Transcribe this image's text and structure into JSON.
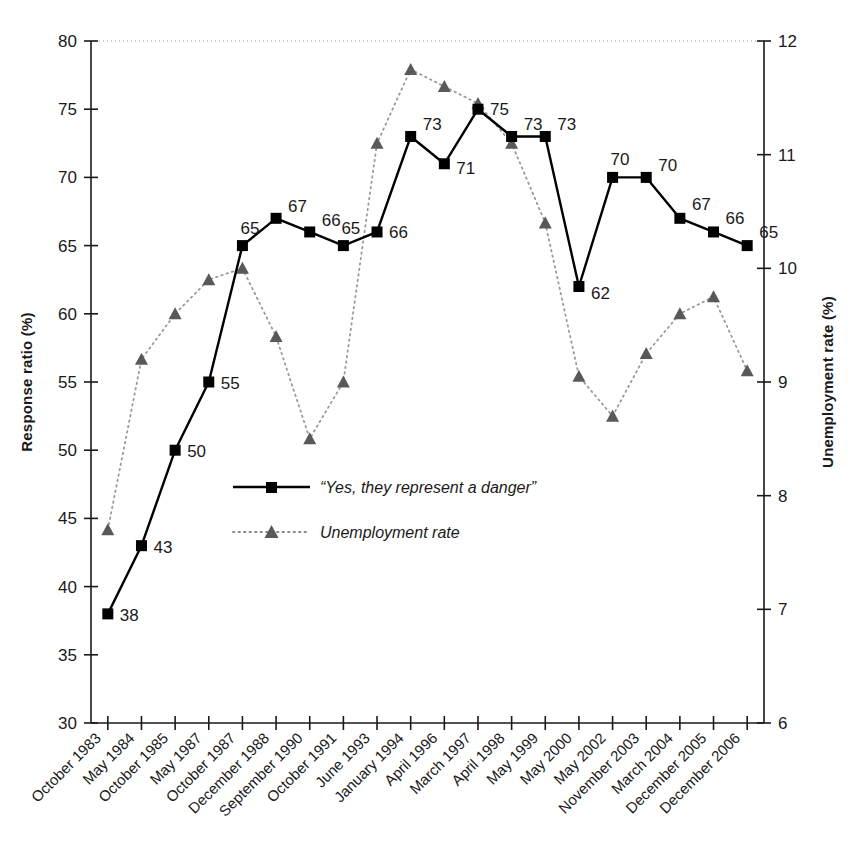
{
  "chart_data": {
    "type": "line",
    "title": "",
    "xlabel": "",
    "ylabel": "Response ratio (%)",
    "y2label": "Unemployment rate (%)",
    "ylim": [
      30,
      80
    ],
    "y2lim": [
      6,
      12
    ],
    "yticks": [
      30,
      35,
      40,
      45,
      50,
      55,
      60,
      65,
      70,
      75,
      80
    ],
    "y2ticks": [
      6,
      7,
      8,
      9,
      10,
      11,
      12
    ],
    "grid": false,
    "legend_position": "center",
    "categories": [
      "October 1983",
      "May 1984",
      "October 1985",
      "May 1987",
      "October 1987",
      "December 1988",
      "September 1990",
      "October 1991",
      "June 1993",
      "January 1994",
      "April 1996",
      "March 1997",
      "April 1998",
      "May 1999",
      "May 2000",
      "May 2002",
      "November 2003",
      "March 2004",
      "December 2005",
      "December 2006"
    ],
    "series": [
      {
        "name": "“Yes, they represent a danger”",
        "axis": "left",
        "marker": "square",
        "line_style": "solid",
        "color": "#000000",
        "labels_shown": true,
        "values": [
          38,
          43,
          50,
          55,
          65,
          67,
          66,
          65,
          66,
          73,
          71,
          75,
          73,
          73,
          62,
          70,
          70,
          67,
          66,
          65
        ]
      },
      {
        "name": "Unemployment rate",
        "axis": "right",
        "marker": "triangle",
        "line_style": "dotted",
        "color": "#595959",
        "labels_shown": false,
        "values": [
          7.7,
          9.2,
          9.6,
          9.9,
          10.0,
          9.4,
          8.5,
          9.0,
          11.1,
          11.75,
          11.6,
          11.45,
          11.1,
          10.4,
          9.05,
          8.7,
          9.25,
          9.6,
          9.75,
          9.1
        ]
      }
    ]
  },
  "legend": {
    "items": [
      {
        "label": "“Yes, they represent a danger”",
        "marker": "square",
        "style": "solid"
      },
      {
        "label": "Unemployment rate",
        "marker": "triangle",
        "style": "dotted"
      }
    ]
  },
  "axes": {
    "left_title": "Response ratio (%)",
    "right_title": "Unemployment rate (%)"
  }
}
